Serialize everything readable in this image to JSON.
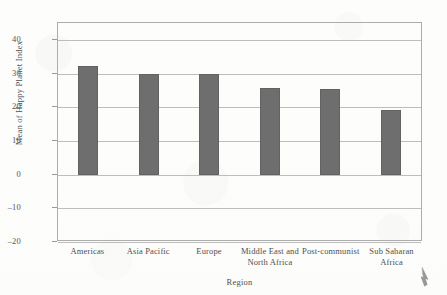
{
  "chart_data": {
    "type": "bar",
    "title": "",
    "xlabel": "Region",
    "ylabel": "Mean of Happy Planet Index",
    "categories": [
      "Americas",
      "Asia Pacific",
      "Europe",
      "Middle East and North Africa",
      "Post-communist",
      "Sub Saharan Africa"
    ],
    "category_lines": [
      [
        "Americas"
      ],
      [
        "Asia Pacific"
      ],
      [
        "Europe"
      ],
      [
        "Middle East and",
        "North Africa"
      ],
      [
        "Post-communist"
      ],
      [
        "Sub Saharan",
        "Africa"
      ]
    ],
    "values": [
      32.2,
      29.8,
      29.8,
      25.7,
      25.5,
      19.2
    ],
    "ylim": [
      -20,
      45
    ],
    "yticks": [
      40,
      30,
      20,
      10,
      0,
      -10,
      -20
    ],
    "ytick_labels": [
      "40",
      "30",
      "20",
      "10",
      "0",
      "–10",
      "–20"
    ],
    "grid": true,
    "legend": "none",
    "bar_color": "#6e6e6e",
    "frame_color": "#adadad",
    "gridline_color": "#bdbdbd",
    "background_color": "#fdfdfb"
  },
  "figure": {
    "cursor_artifact": "mouse-cursor"
  }
}
